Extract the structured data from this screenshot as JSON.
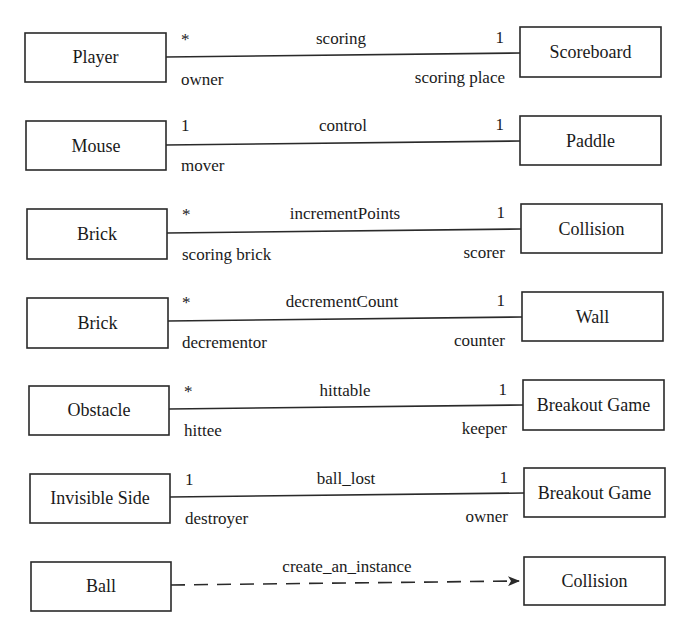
{
  "diagram": {
    "type": "UML class association diagram",
    "associations": [
      {
        "kind": "association",
        "left": {
          "class": "Player",
          "multiplicity": "*",
          "role": "owner"
        },
        "name": "scoring",
        "right": {
          "class": "Scoreboard",
          "multiplicity": "1",
          "role": "scoring place"
        }
      },
      {
        "kind": "association",
        "left": {
          "class": "Mouse",
          "multiplicity": "1",
          "role": "mover"
        },
        "name": "control",
        "right": {
          "class": "Paddle",
          "multiplicity": "1",
          "role": ""
        }
      },
      {
        "kind": "association",
        "left": {
          "class": "Brick",
          "multiplicity": "*",
          "role": "scoring brick"
        },
        "name": "incrementPoints",
        "right": {
          "class": "Collision",
          "multiplicity": "1",
          "role": "scorer"
        }
      },
      {
        "kind": "association",
        "left": {
          "class": "Brick",
          "multiplicity": "*",
          "role": "decrementor"
        },
        "name": "decrementCount",
        "right": {
          "class": "Wall",
          "multiplicity": "1",
          "role": "counter"
        }
      },
      {
        "kind": "association",
        "left": {
          "class": "Obstacle",
          "multiplicity": "*",
          "role": "hittee"
        },
        "name": "hittable",
        "right": {
          "class": "Breakout Game",
          "multiplicity": "1",
          "role": "keeper"
        }
      },
      {
        "kind": "association",
        "left": {
          "class": "Invisible Side",
          "multiplicity": "1",
          "role": "destroyer"
        },
        "name": "ball_lost",
        "right": {
          "class": "Breakout Game",
          "multiplicity": "1",
          "role": "owner"
        }
      },
      {
        "kind": "dependency",
        "left": {
          "class": "Ball",
          "multiplicity": "",
          "role": ""
        },
        "name": "create_an_instance",
        "right": {
          "class": "Collision",
          "multiplicity": "",
          "role": ""
        }
      }
    ]
  }
}
